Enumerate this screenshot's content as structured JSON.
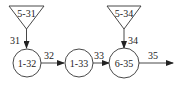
{
  "diagram": {
    "sources": [
      {
        "id": "5-31",
        "label": "5-31"
      },
      {
        "id": "5-34",
        "label": "5-34"
      }
    ],
    "nodes": [
      {
        "id": "1-32",
        "label": "1-32"
      },
      {
        "id": "1-33",
        "label": "1-33"
      },
      {
        "id": "6-35",
        "label": "6-35"
      }
    ],
    "edges": [
      {
        "from": "5-31",
        "to": "1-32",
        "label": "31"
      },
      {
        "from": "1-32",
        "to": "1-33",
        "label": "32"
      },
      {
        "from": "1-33",
        "to": "6-35",
        "label": "33"
      },
      {
        "from": "5-34",
        "to": "6-35",
        "label": "34"
      },
      {
        "from": "6-35",
        "to": "out",
        "label": "35"
      }
    ]
  }
}
